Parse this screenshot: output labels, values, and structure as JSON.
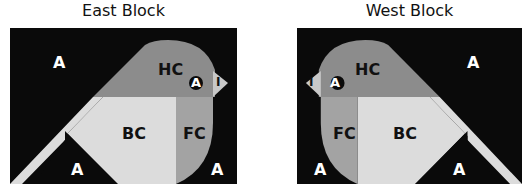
{
  "colors": {
    "background": "#0a0a0a",
    "head_crown": "#8c8c8c",
    "body_crown": "#dcdcdc",
    "front_crown": "#a3a3a3",
    "interior": "#c8c8c8",
    "label_dark": "#111111",
    "label_light": "#ffffff"
  },
  "panels": [
    {
      "title": "East Block",
      "labels": {
        "air_top_left": "A",
        "head_crown": "HC",
        "eye_air": "A",
        "interior": "I",
        "body_crown": "BC",
        "front_crown": "FC",
        "air_bottom_left": "A",
        "air_bottom_right": "A"
      }
    },
    {
      "title": "West Block",
      "labels": {
        "air_top_right": "A",
        "head_crown": "HC",
        "eye_air": "A",
        "interior": "I",
        "body_crown": "BC",
        "front_crown": "FC",
        "air_bottom_left": "A",
        "air_bottom_right": "A"
      }
    }
  ]
}
